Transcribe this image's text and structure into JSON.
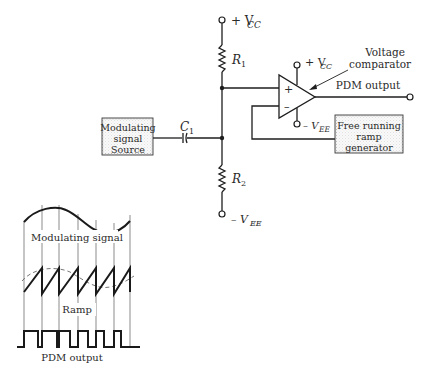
{
  "diagram": {
    "supply": {
      "vcc_top": "+ V",
      "vcc_sub": "CC",
      "vee_bottom": "– V",
      "vee_sub": "EE",
      "comp_vcc": "+ V",
      "comp_vcc_sub": "CC",
      "comp_vee": "– V",
      "comp_vee_sub": "EE"
    },
    "components": {
      "r1": {
        "label": "R",
        "sub": "1"
      },
      "r2": {
        "label": "R",
        "sub": "2"
      },
      "c1": {
        "label": "C",
        "sub": "1"
      },
      "comparator": {
        "label_line1": "Voltage",
        "label_line2": "comparator",
        "plus": "+",
        "minus": "–"
      }
    },
    "blocks": {
      "modulating_source": {
        "line1": "Modulating",
        "line2": "signal",
        "line3": "Source"
      },
      "ramp_generator": {
        "line1": "Free running",
        "line2": "ramp",
        "line3": "generator"
      }
    },
    "output_label": "PDM output",
    "waveforms": {
      "modulating_label": "Modulating signal",
      "ramp_label": "Ramp",
      "pdm_label": "PDM output"
    },
    "colors": {
      "line": "#1e1e1e",
      "block_fill": "#ececec",
      "text": "#2a2a2a"
    }
  }
}
